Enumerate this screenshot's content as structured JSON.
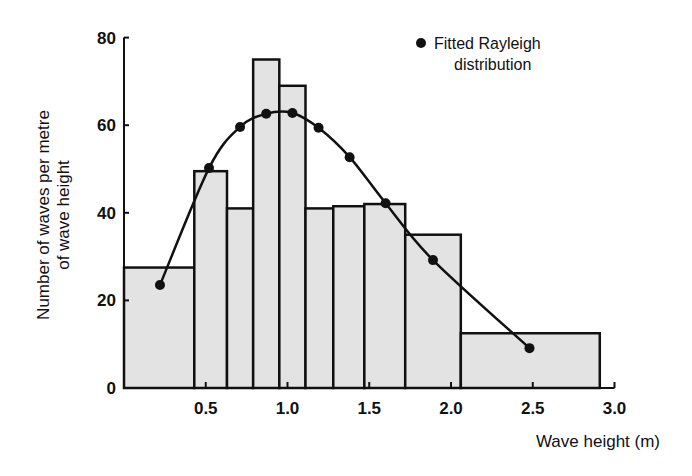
{
  "chart_data": {
    "type": "bar",
    "subtype": "histogram-with-fitted-curve",
    "title": "",
    "xlabel": "Wave height (m)",
    "ylabel": "Number of waves per metre of wave height",
    "ylabel_lines": [
      "Number of waves per metre",
      "of wave height"
    ],
    "xlim": [
      0,
      3.0
    ],
    "ylim": [
      0,
      80
    ],
    "xticks": [
      0.5,
      1.0,
      1.5,
      2.0,
      2.5,
      3.0
    ],
    "xtick_labels": [
      "0.5",
      "1.0",
      "1.5",
      "2.0",
      "2.5",
      "3.0"
    ],
    "yticks": [
      0,
      20,
      40,
      60,
      80
    ],
    "ytick_labels": [
      "0",
      "20",
      "40",
      "60",
      "80"
    ],
    "grid": false,
    "legend_position": "upper-right",
    "histogram": {
      "name": "Observed wave heights",
      "bins": [
        {
          "x0": 0.0,
          "x1": 0.43,
          "value": 27.5
        },
        {
          "x0": 0.43,
          "x1": 0.63,
          "value": 49.5
        },
        {
          "x0": 0.63,
          "x1": 0.79,
          "value": 41
        },
        {
          "x0": 0.79,
          "x1": 0.95,
          "value": 75
        },
        {
          "x0": 0.95,
          "x1": 1.11,
          "value": 69
        },
        {
          "x0": 1.11,
          "x1": 1.28,
          "value": 41
        },
        {
          "x0": 1.28,
          "x1": 1.47,
          "value": 41.5
        },
        {
          "x0": 1.47,
          "x1": 1.72,
          "value": 42
        },
        {
          "x0": 1.72,
          "x1": 2.06,
          "value": 35
        },
        {
          "x0": 2.06,
          "x1": 2.91,
          "value": 12.5
        }
      ],
      "fill": "#e3e3e3",
      "stroke": "#111111"
    },
    "series": [
      {
        "name": "Fitted Rayleigh distribution",
        "type": "line",
        "marker": "filled-circle",
        "x": [
          0.22,
          0.52,
          0.71,
          0.87,
          1.03,
          1.19,
          1.38,
          1.6,
          1.89,
          2.48
        ],
        "values": [
          23.5,
          50.2,
          59.6,
          62.6,
          62.8,
          59.4,
          52.7,
          42.2,
          29.2,
          9.1
        ]
      }
    ],
    "legend": [
      {
        "label_lines": [
          "Fitted Rayleigh",
          "distribution"
        ],
        "marker": "filled-circle"
      }
    ]
  }
}
